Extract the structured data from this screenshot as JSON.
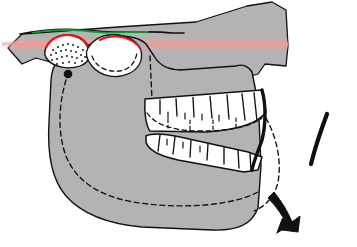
{
  "figure": {
    "title": "Lateral view of maxilla and mandible with surgical repositioning",
    "background_color": "#ffffff"
  },
  "colors": {
    "bone_fill": "#b3b3b3",
    "bone_outline": "#111111",
    "tooth_fill": "#ffffff",
    "tooth_outline": "#111111",
    "osteotomy_band": "#f2a09a",
    "osteotomy_band_soft": "#f6c9c4",
    "marker_red": "#e11b1b",
    "marker_green": "#0f9a3c",
    "graft_fill": "#ffffff",
    "stipple_dot": "#111111",
    "arrow_black": "#111111",
    "landmark_dot": "#111111",
    "dashed_outline": "#111111"
  },
  "annotations": {
    "maxilla_label": "maxilla",
    "mandible_label": "mandible",
    "graft_label": "bone-graft-stippled-region",
    "condyle_landmark_label": "condyle-landmark-point",
    "osteotomy_line_label": "osteotomy-cut-line",
    "original_position_label": "original-mandible-position-dashed",
    "rotation_arrow_label": "mandible-rotation-direction",
    "arc_marker_label": "rotation-arc-marker"
  },
  "elements": {
    "upper_teeth_count": 8,
    "lower_teeth_count": 8,
    "stipple_dot_count": 26,
    "red_arc_count": 2,
    "green_line_count": 1,
    "arrow_count": 1,
    "arc_marker_count": 1
  },
  "geometry": {
    "canvas": {
      "width": 357,
      "height": 247
    },
    "cranial_base_polygon": "M 8,48 L 22,34 L 118,27 L 196,22 L 247,6 L 272,2 L 286,10 L 288,46 L 286,66 L 265,64 L 258,74 L 244,78 L 236,70 L 176,70 L 160,66 L 150,52 L 128,40 L 108,38 L 92,44 L 78,44 L 64,56 L 50,62 L 36,58 L 22,64 Z",
    "palate_top_line": "M 22,34 L 60,30 L 100,33 L 140,31 L 168,34 L 178,33",
    "green_segment": "M 36,32 L 76,30 L 118,32 L 150,31",
    "osteotomy_band_y": 44,
    "osteotomy_band_x1": 4,
    "osteotomy_band_x2": 290,
    "red_arc_1": "M 48,46 Q 62,36 82,45",
    "red_arc_2": "M 104,45 Q 120,35 138,45",
    "graft_region": "M 47,47 Q 62,36 82,46 Q 92,55 86,62 Q 70,68 56,62 Q 46,56 47,47 Z",
    "mandible_body": "M 58,52 Q 52,58 50,70 L 48,120 Q 46,160 62,188 Q 80,214 120,224 L 214,230 Q 246,230 258,214 L 262,150 L 258,96 L 252,70 L 236,70 L 176,70 L 160,66 L 150,52 L 128,40 L 108,38 L 92,44 L 78,44 Z",
    "condyle_dot": {
      "cx": 68,
      "cy": 74,
      "r": 4.2
    },
    "mandible_dashed_original": "M 68,80 Q 60,120 72,156 Q 92,196 140,202 Q 200,206 244,196 Q 268,188 274,160 L 276,120",
    "ramus_dashed": "M 150,56 L 152,96",
    "upper_tooth_y_top": 96,
    "upper_tooth_y_bot": 124,
    "lower_tooth_y_top": 138,
    "lower_tooth_y_bot": 164,
    "arrow_path": "M 258,196 Q 272,214 282,224",
    "arc_marker_path": "M 326,116 Q 318,140 312,162"
  }
}
